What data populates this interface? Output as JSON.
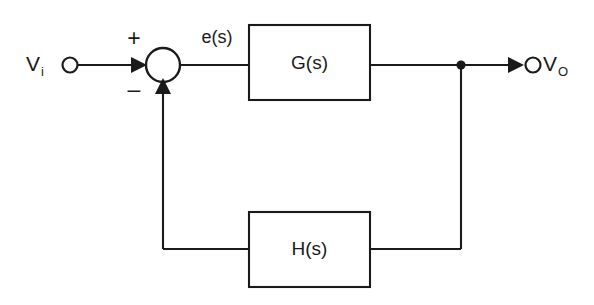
{
  "diagram": {
    "type": "control-system-block-diagram",
    "background_color": "#ffffff",
    "line_color": "#1a1a1a",
    "input_terminal": {
      "label_main": "V",
      "label_sub": "i",
      "name": "input-terminal-vi"
    },
    "output_terminal": {
      "label_main": "V",
      "label_sub": "O",
      "name": "output-terminal-vo"
    },
    "summing_junction": {
      "plus_sign": "+",
      "minus_sign": "–",
      "name": "summing-junction"
    },
    "error_signal": {
      "label": "e(s)"
    },
    "blocks": [
      {
        "label": "G(s)",
        "role": "forward-path-transfer-function"
      },
      {
        "label": "H(s)",
        "role": "feedback-path-transfer-function"
      }
    ],
    "takeoff_node": {
      "name": "output-takeoff-node"
    }
  }
}
